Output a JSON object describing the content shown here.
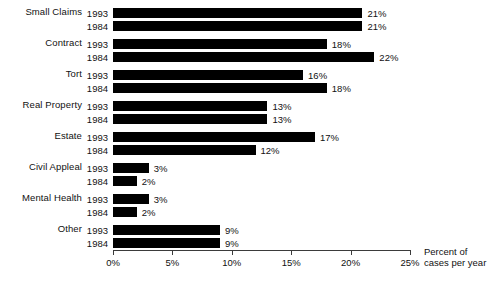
{
  "chart_data": {
    "type": "bar",
    "orientation": "horizontal",
    "title": "",
    "xlabel": "Percent of cases per year",
    "ylabel": "",
    "xlim": [
      0,
      25
    ],
    "grid": false,
    "legend_position": "none",
    "xticks": [
      "0%",
      "5%",
      "10%",
      "15%",
      "20%",
      "25%"
    ],
    "xtick_values": [
      0,
      5,
      10,
      15,
      20,
      25
    ],
    "categories": [
      "Small Claims",
      "Contract",
      "Tort",
      "Real Property",
      "Estate",
      "Civil Appleal",
      "Mental Health",
      "Other"
    ],
    "series": [
      {
        "name": "1993",
        "values": [
          21,
          18,
          16,
          13,
          17,
          3,
          3,
          9
        ],
        "labels": [
          "21%",
          "18%",
          "16%",
          "13%",
          "17%",
          "3%",
          "3%",
          "9%"
        ]
      },
      {
        "name": "1984",
        "values": [
          21,
          22,
          18,
          13,
          12,
          2,
          2,
          9
        ],
        "labels": [
          "21%",
          "22%",
          "18%",
          "13%",
          "12%",
          "2%",
          "2%",
          "9%"
        ]
      }
    ]
  },
  "axis": {
    "caption_line1": "Percent of",
    "caption_line2": "cases per year"
  },
  "colors": {
    "bar": "#000000",
    "axis": "#3b3b3b",
    "text": "#111111",
    "background": "#ffffff"
  }
}
